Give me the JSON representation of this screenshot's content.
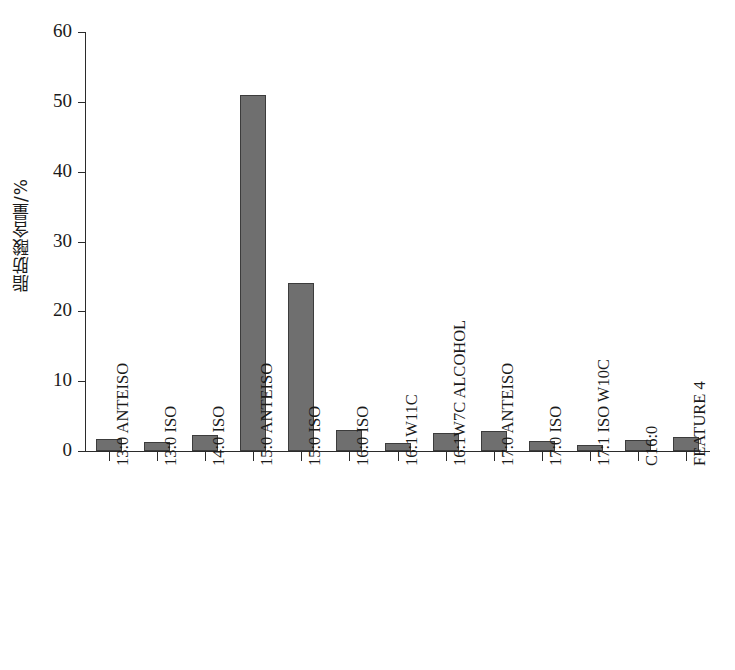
{
  "chart_data": {
    "type": "bar",
    "title": "",
    "xlabel": "",
    "ylabel": "脂肪酸含量/%",
    "ylim": [
      0,
      60
    ],
    "yticks": [
      0,
      10,
      20,
      30,
      40,
      50,
      60
    ],
    "grid": false,
    "legend": false,
    "bar_color": "#6f6f6f",
    "bar_edge_color": "#3c3c3c",
    "axis_color": "#2b2b2b",
    "categories": [
      "13:0 ANTEISO",
      "13:0 ISO",
      "14:0 ISO",
      "15:0 ANTEISO",
      "15:0 ISO",
      "16:0 ISO",
      "16:1W11C",
      "16:1W7C ALCOHOL",
      "17:0 ANTEISO",
      "17:0 ISO",
      "17:1 ISO W10C",
      "C16:0",
      "FEATURE 4"
    ],
    "values": [
      1.7,
      1.3,
      2.3,
      51.0,
      24.0,
      3.0,
      1.1,
      2.6,
      2.9,
      1.5,
      0.9,
      1.6,
      2.0
    ]
  }
}
